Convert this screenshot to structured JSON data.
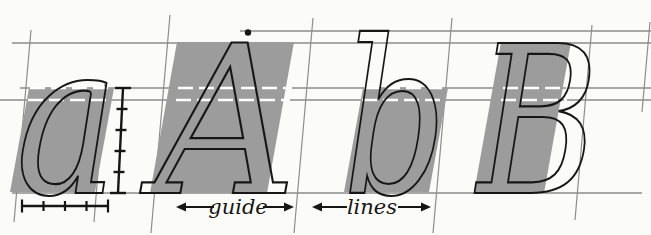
{
  "figure": {
    "letters": [
      {
        "char": "a",
        "case": "lowercase",
        "x": 16,
        "baseline": 193,
        "font_size": 212,
        "width": 102
      },
      {
        "char": "A",
        "case": "capital",
        "x": 155,
        "baseline": 193,
        "font_size": 206,
        "width": 142
      },
      {
        "char": "b",
        "case": "lowercase",
        "x": 343,
        "baseline": 193,
        "font_size": 214,
        "width": 104
      },
      {
        "char": "B",
        "case": "capital",
        "x": 477,
        "baseline": 193,
        "font_size": 206,
        "width": 122
      }
    ],
    "labels": [
      {
        "text": "guide",
        "tx": 238,
        "ty": 214,
        "y": 207,
        "arrows": [
          {
            "tip": 176,
            "tail": 214,
            "dir": "left"
          },
          {
            "tip": 294,
            "tail": 263,
            "dir": "right"
          }
        ]
      },
      {
        "text": "lines",
        "tx": 372,
        "ty": 214,
        "y": 207,
        "arrows": [
          {
            "tip": 312,
            "tail": 347,
            "dir": "left"
          },
          {
            "tip": 431,
            "tail": 398,
            "dir": "right"
          }
        ]
      }
    ],
    "apex_dot": {
      "x": 248,
      "y": 32.5,
      "radius": 3.2
    }
  },
  "guide_lines": {
    "horizontal": [
      {
        "name": "ascender-line",
        "y": 31,
        "x1": 240,
        "x2": 651,
        "w": 1.3
      },
      {
        "name": "cap-line",
        "y": 43,
        "x1": 12,
        "x2": 651,
        "w": 1.3
      },
      {
        "name": "waist-line",
        "y": 88,
        "x1": 20,
        "x2": 651,
        "w": 1.3
      },
      {
        "name": "waist-line-2",
        "y": 100,
        "x1": 0,
        "x2": 651,
        "w": 1.3
      },
      {
        "name": "baseline",
        "y": 193,
        "x1": 12,
        "x2": 642,
        "w": 1.3
      }
    ],
    "slanted": [
      {
        "name": "slant-guide-1",
        "x1": 31,
        "y1": 30,
        "x2": 14,
        "y2": 222
      },
      {
        "name": "slant-guide-2",
        "x1": 105,
        "y1": 84,
        "x2": 94,
        "y2": 222
      },
      {
        "name": "slant-guide-3",
        "x1": 170,
        "y1": 15,
        "x2": 151,
        "y2": 233
      },
      {
        "name": "slant-guide-4",
        "x1": 313,
        "y1": 18,
        "x2": 294,
        "y2": 233
      },
      {
        "name": "slant-guide-5",
        "x1": 452,
        "y1": 18,
        "x2": 433,
        "y2": 233
      },
      {
        "name": "slant-guide-6",
        "x1": 592,
        "y1": 25,
        "x2": 575,
        "y2": 220
      },
      {
        "name": "slant-guide-7",
        "x1": 650,
        "y1": 22,
        "x2": 642,
        "y2": 112
      }
    ]
  },
  "blocks": [
    {
      "name": "slant-block-a",
      "points": "29,88 114,88 95,192 10,192"
    },
    {
      "name": "slant-block-cap-a",
      "points": "177,42 294,42 267,193 150,193"
    },
    {
      "name": "slant-block-b",
      "points": "363,88 448,88 429,192 344,192"
    },
    {
      "name": "slant-block-cap-b",
      "points": "501,42 571,42 544,193 474,193"
    }
  ],
  "knockouts": {
    "dash": "15 6",
    "width": 2.6,
    "segments": [
      {
        "y": 88,
        "x1": 30,
        "x2": 112
      },
      {
        "y": 88,
        "x1": 178,
        "x2": 292
      },
      {
        "y": 88,
        "x1": 364,
        "x2": 446
      },
      {
        "y": 88,
        "x1": 503,
        "x2": 569
      },
      {
        "y": 100,
        "x1": 28,
        "x2": 111
      },
      {
        "y": 100,
        "x1": 176,
        "x2": 290
      },
      {
        "y": 100,
        "x1": 362,
        "x2": 444
      },
      {
        "y": 100,
        "x1": 501,
        "x2": 567
      }
    ]
  },
  "pen_ladder": {
    "x_top": 123,
    "y_top": 88,
    "x_bottom": 118,
    "y_bottom": 193,
    "segments": 5,
    "end_tick_len": 16,
    "mid_tick_len": 11
  },
  "width_ruler": {
    "y": 206,
    "x1": 22,
    "x2": 108,
    "segments": 4,
    "end_tick_len": 13,
    "mid_tick_len": 10
  },
  "colors": {
    "background": "#fbfbf9",
    "block_grey": "#9c9c9c",
    "line_grey": "#8d8d8d",
    "ink": "#161616",
    "knockout_white": "#ffffff"
  }
}
